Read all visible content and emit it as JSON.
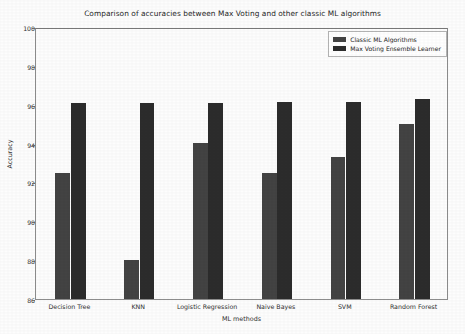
{
  "chart_data": {
    "type": "bar",
    "title": "Comparison of accuracies between Max Voting and other classic ML algorithms",
    "xlabel": "ML methods",
    "ylabel": "Accuracy",
    "ylim": [
      86,
      100
    ],
    "yticks": [
      86,
      88,
      90,
      92,
      94,
      96,
      98,
      100
    ],
    "grid": false,
    "legend_position": "upper right",
    "categories": [
      "Decision Tree",
      "KNN",
      "Logistic Regression",
      "Naive Bayes",
      "SVM",
      "Random Forest"
    ],
    "series": [
      {
        "name": "Classic ML Algorithms",
        "color": "#434343",
        "values": [
          92.5,
          88.0,
          94.05,
          92.5,
          93.3,
          95.0
        ]
      },
      {
        "name": "Max Voting Ensemble Learner",
        "color": "#2c2c2c",
        "values": [
          96.1,
          96.1,
          96.1,
          96.15,
          96.15,
          96.3
        ]
      }
    ]
  }
}
